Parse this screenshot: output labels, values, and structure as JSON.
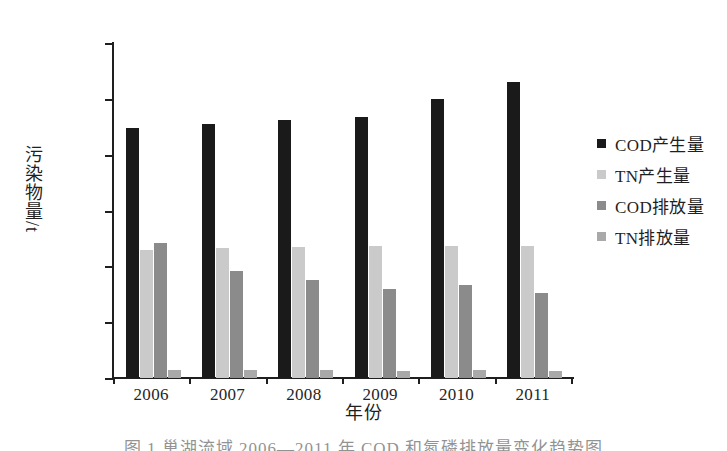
{
  "chart_data": {
    "type": "bar",
    "title": "",
    "xlabel": "年份",
    "ylabel": "污染物量/t",
    "categories": [
      "2006",
      "2007",
      "2008",
      "2009",
      "2010",
      "2011"
    ],
    "ylim": [
      0,
      60000
    ],
    "yticks": [
      0,
      10000,
      20000,
      30000,
      40000,
      50000,
      60000
    ],
    "ytick_labels": [
      "0",
      "10 000",
      "20 000",
      "30 000",
      "40 000",
      "50 000",
      "60 000"
    ],
    "grid": false,
    "legend_position": "right",
    "series": [
      {
        "name": "COD产生量",
        "color": "#1a1a1a",
        "values": [
          44800,
          45500,
          46200,
          46800,
          50000,
          53100
        ]
      },
      {
        "name": "TN产生量",
        "color": "#cacaca",
        "values": [
          23000,
          23200,
          23400,
          23600,
          23600,
          23700
        ]
      },
      {
        "name": "COD排放量",
        "color": "#8b8b8b",
        "values": [
          24200,
          19100,
          17500,
          16000,
          16600,
          15200
        ]
      },
      {
        "name": "TN排放量",
        "color": "#a9a9a9",
        "values": [
          1500,
          1500,
          1350,
          1300,
          1350,
          1250
        ]
      }
    ]
  },
  "axis": {
    "y_title": "污染物量/t",
    "x_title": "年份"
  },
  "caption": {
    "text": "图  1    巢湖流域 2006—2011 年 COD 和氮磷排放量变化趋势图"
  }
}
